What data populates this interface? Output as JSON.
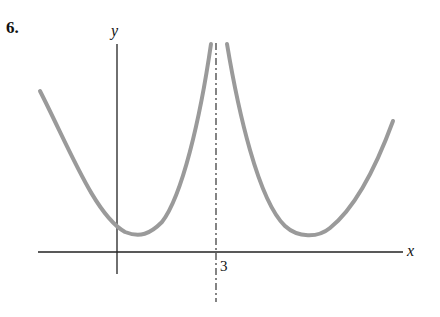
{
  "problem": {
    "number": "6."
  },
  "axes": {
    "x_label": "x",
    "y_label": "y",
    "tick_label": "3"
  },
  "figure": {
    "asymptote_x": 3,
    "curve_color": "#9a9a9a",
    "axis_color": "#111111"
  }
}
